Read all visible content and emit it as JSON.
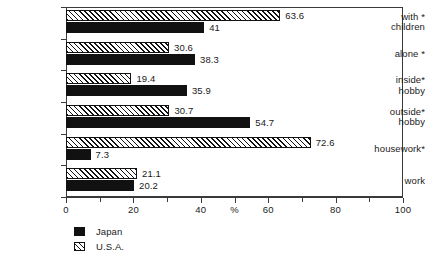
{
  "chart_data": {
    "type": "bar",
    "orientation": "horizontal",
    "title": "",
    "xlabel": "%",
    "ylabel": "",
    "xlim": [
      0,
      100
    ],
    "xticks": [
      0,
      10,
      20,
      30,
      40,
      50,
      60,
      70,
      80,
      90,
      100
    ],
    "xtick_labels": [
      "0",
      "",
      "20",
      "",
      "40",
      "%",
      "60",
      "",
      "80",
      "",
      "100"
    ],
    "grid": false,
    "legend_position": "bottom-left",
    "categories": [
      "with children*",
      "alone*",
      "inside* hobby",
      "outside* hobby",
      "housework*",
      "work"
    ],
    "series": [
      {
        "name": "Japan",
        "values": [
          41,
          38.3,
          35.9,
          54.7,
          7.3,
          20.2
        ],
        "color": "#111111",
        "pattern": "solid"
      },
      {
        "name": "U.S.A.",
        "values": [
          63.6,
          30.6,
          19.4,
          30.7,
          72.6,
          21.1
        ],
        "color": "#111111",
        "pattern": "diagonal-hatch"
      }
    ]
  },
  "axis": {
    "x_ticks": [
      {
        "value": 0,
        "label": "0",
        "major": true
      },
      {
        "value": 10,
        "label": "",
        "major": false
      },
      {
        "value": 20,
        "label": "20",
        "major": true
      },
      {
        "value": 30,
        "label": "",
        "major": false
      },
      {
        "value": 40,
        "label": "40",
        "major": true
      },
      {
        "value": 50,
        "label": "%",
        "major": true
      },
      {
        "value": 60,
        "label": "60",
        "major": true
      },
      {
        "value": 70,
        "label": "",
        "major": false
      },
      {
        "value": 80,
        "label": "80",
        "major": true
      },
      {
        "value": 90,
        "label": "",
        "major": false
      },
      {
        "value": 100,
        "label": "100",
        "major": true
      }
    ]
  },
  "rows": [
    {
      "name": "with-children",
      "label_line1": "with  *",
      "label_line2": "children",
      "usa": {
        "value": 63.6,
        "label": "63.6"
      },
      "japan": {
        "value": 41,
        "label": "41"
      }
    },
    {
      "name": "alone",
      "label_line1": "alone *",
      "label_line2": "",
      "usa": {
        "value": 30.6,
        "label": "30.6"
      },
      "japan": {
        "value": 38.3,
        "label": "38.3"
      }
    },
    {
      "name": "inside-hobby",
      "label_line1": "inside*",
      "label_line2": "hobby",
      "usa": {
        "value": 19.4,
        "label": "19.4"
      },
      "japan": {
        "value": 35.9,
        "label": "35.9"
      }
    },
    {
      "name": "outside-hobby",
      "label_line1": "outside*",
      "label_line2": "hobby",
      "usa": {
        "value": 30.7,
        "label": "30.7"
      },
      "japan": {
        "value": 54.7,
        "label": "54.7"
      }
    },
    {
      "name": "housework",
      "label_line1": "housework*",
      "label_line2": "",
      "usa": {
        "value": 72.6,
        "label": "72.6"
      },
      "japan": {
        "value": 7.3,
        "label": "7.3"
      }
    },
    {
      "name": "work",
      "label_line1": "work",
      "label_line2": "",
      "usa": {
        "value": 21.1,
        "label": "21.1"
      },
      "japan": {
        "value": 20.2,
        "label": "20.2"
      }
    }
  ],
  "legend": {
    "items": [
      {
        "name": "japan",
        "label": "Japan",
        "pattern": "solid"
      },
      {
        "name": "usa",
        "label": "U.S.A.",
        "pattern": "diagonal-hatch"
      }
    ]
  },
  "colors": {
    "bar_solid": "#111111",
    "hatch": "#111111",
    "axis": "#3a3a3a",
    "text": "#1a1a1a",
    "background": "#ffffff"
  }
}
